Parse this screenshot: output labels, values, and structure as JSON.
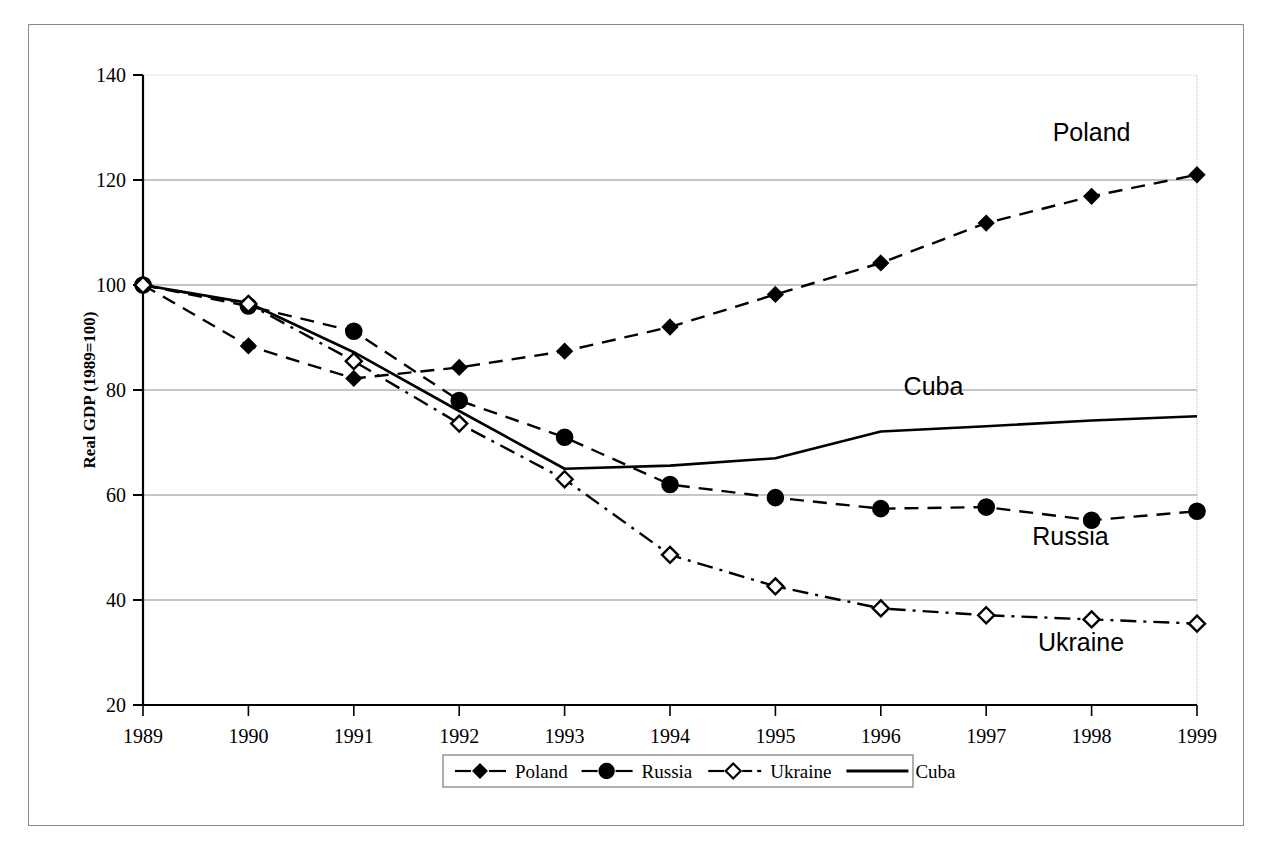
{
  "figure": {
    "title_partial": "g",
    "frame_color": "#8a8a8a"
  },
  "chart_data": {
    "type": "line",
    "title": "",
    "xlabel": "",
    "ylabel": "Real GDP (1989=100)",
    "categories": [
      "1989",
      "1990",
      "1991",
      "1992",
      "1993",
      "1994",
      "1995",
      "1996",
      "1997",
      "1998",
      "1999"
    ],
    "x": [
      1989,
      1990,
      1991,
      1992,
      1993,
      1994,
      1995,
      1996,
      1997,
      1998,
      1999
    ],
    "ylim": [
      20,
      140
    ],
    "yticks": [
      "140",
      "120",
      "100",
      "80",
      "60",
      "40",
      "20"
    ],
    "ytick_values": [
      140,
      120,
      100,
      80,
      60,
      40,
      20
    ],
    "grid": true,
    "legend_position": "bottom",
    "series": [
      {
        "name": "Poland",
        "marker": "filled-diamond",
        "linestyle": "dashed",
        "color": "#000000",
        "values": [
          100,
          88.4,
          82.2,
          84.3,
          87.4,
          92.0,
          98.2,
          104.2,
          111.8,
          116.9,
          121.0
        ]
      },
      {
        "name": "Russia",
        "marker": "filled-circle",
        "linestyle": "dashed",
        "color": "#000000",
        "values": [
          100,
          96.0,
          91.2,
          78.0,
          71.0,
          62.0,
          59.5,
          57.4,
          57.7,
          55.2,
          56.9
        ]
      },
      {
        "name": "Ukraine",
        "marker": "open-diamond",
        "linestyle": "dash-dot",
        "color": "#000000",
        "values": [
          100,
          96.4,
          85.5,
          73.6,
          63.0,
          48.6,
          42.6,
          38.4,
          37.1,
          36.3,
          35.5
        ]
      },
      {
        "name": "Cuba",
        "marker": "none",
        "linestyle": "solid",
        "color": "#000000",
        "values": [
          100,
          96.6,
          87.2,
          76.0,
          65.0,
          65.6,
          67.0,
          72.1,
          73.1,
          74.2,
          75.0
        ]
      }
    ],
    "annotations": [
      {
        "text": "Poland",
        "x": 1998.0,
        "y": 127.5
      },
      {
        "text": "Cuba",
        "x": 1996.5,
        "y": 79.0
      },
      {
        "text": "Russia",
        "x": 1997.8,
        "y": 50.5
      },
      {
        "text": "Ukraine",
        "x": 1997.9,
        "y": 30.2
      }
    ]
  },
  "legend": {
    "items": [
      {
        "label": "Poland",
        "marker": "filled-diamond",
        "linestyle": "dashed"
      },
      {
        "label": "Russia",
        "marker": "filled-circle",
        "linestyle": "dashed"
      },
      {
        "label": "Ukraine",
        "marker": "open-diamond",
        "linestyle": "dash-dot"
      },
      {
        "label": "Cuba",
        "marker": "none",
        "linestyle": "solid"
      }
    ]
  }
}
